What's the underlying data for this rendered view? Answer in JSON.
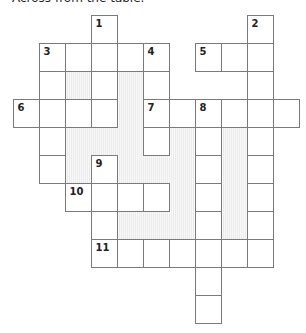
{
  "intro_text": "Across from the table.",
  "crossword": {
    "columns": 11,
    "rows": 11,
    "cells": [
      {
        "r": 0,
        "c": 3,
        "num": "1"
      },
      {
        "r": 0,
        "c": 9,
        "num": "2"
      },
      {
        "r": 1,
        "c": 1,
        "num": "3"
      },
      {
        "r": 1,
        "c": 2
      },
      {
        "r": 1,
        "c": 3
      },
      {
        "r": 1,
        "c": 4
      },
      {
        "r": 1,
        "c": 5,
        "num": "4"
      },
      {
        "r": 1,
        "c": 7,
        "num": "5"
      },
      {
        "r": 1,
        "c": 8
      },
      {
        "r": 1,
        "c": 9
      },
      {
        "r": 2,
        "c": 1
      },
      {
        "r": 2,
        "c": 3
      },
      {
        "r": 2,
        "c": 5
      },
      {
        "r": 2,
        "c": 9
      },
      {
        "r": 3,
        "c": 0,
        "num": "6"
      },
      {
        "r": 3,
        "c": 1
      },
      {
        "r": 3,
        "c": 2
      },
      {
        "r": 3,
        "c": 3
      },
      {
        "r": 3,
        "c": 5,
        "num": "7"
      },
      {
        "r": 3,
        "c": 6
      },
      {
        "r": 3,
        "c": 7,
        "num": "8"
      },
      {
        "r": 3,
        "c": 8
      },
      {
        "r": 3,
        "c": 9
      },
      {
        "r": 3,
        "c": 10
      },
      {
        "r": 4,
        "c": 1
      },
      {
        "r": 4,
        "c": 5
      },
      {
        "r": 4,
        "c": 7
      },
      {
        "r": 4,
        "c": 9
      },
      {
        "r": 5,
        "c": 1
      },
      {
        "r": 5,
        "c": 3,
        "num": "9"
      },
      {
        "r": 5,
        "c": 7
      },
      {
        "r": 5,
        "c": 9
      },
      {
        "r": 6,
        "c": 2,
        "num": "10"
      },
      {
        "r": 6,
        "c": 3
      },
      {
        "r": 6,
        "c": 4
      },
      {
        "r": 6,
        "c": 5
      },
      {
        "r": 6,
        "c": 7
      },
      {
        "r": 6,
        "c": 9
      },
      {
        "r": 7,
        "c": 3
      },
      {
        "r": 7,
        "c": 7
      },
      {
        "r": 7,
        "c": 9
      },
      {
        "r": 8,
        "c": 3,
        "num": "11"
      },
      {
        "r": 8,
        "c": 4
      },
      {
        "r": 8,
        "c": 5
      },
      {
        "r": 8,
        "c": 6
      },
      {
        "r": 8,
        "c": 7
      },
      {
        "r": 8,
        "c": 8
      },
      {
        "r": 8,
        "c": 9
      },
      {
        "r": 9,
        "c": 7
      },
      {
        "r": 10,
        "c": 7
      }
    ],
    "shaded": [
      {
        "r": 2,
        "c": 2
      },
      {
        "r": 2,
        "c": 4
      },
      {
        "r": 3,
        "c": 4
      },
      {
        "r": 4,
        "c": 2
      },
      {
        "r": 4,
        "c": 3
      },
      {
        "r": 4,
        "c": 4
      },
      {
        "r": 4,
        "c": 6
      },
      {
        "r": 4,
        "c": 8
      },
      {
        "r": 5,
        "c": 2
      },
      {
        "r": 5,
        "c": 4
      },
      {
        "r": 5,
        "c": 5
      },
      {
        "r": 5,
        "c": 6
      },
      {
        "r": 5,
        "c": 8
      },
      {
        "r": 6,
        "c": 6
      },
      {
        "r": 6,
        "c": 8
      },
      {
        "r": 7,
        "c": 4
      },
      {
        "r": 7,
        "c": 5
      },
      {
        "r": 7,
        "c": 6
      },
      {
        "r": 7,
        "c": 8
      }
    ]
  }
}
